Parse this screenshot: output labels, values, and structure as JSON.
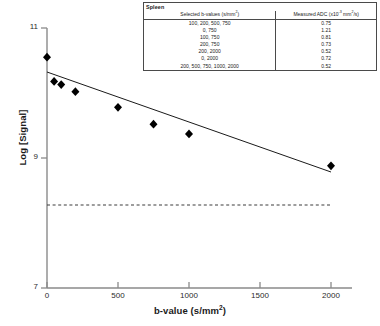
{
  "chart_data": {
    "type": "scatter",
    "title": "",
    "xlabel": "b-value (s/mm2)",
    "ylabel": "Log [Signal]",
    "xlim": [
      0,
      2100
    ],
    "ylim": [
      7,
      11
    ],
    "xticks": [
      0,
      500,
      1000,
      1500,
      2000
    ],
    "yticks": [
      7,
      9,
      11
    ],
    "grid": false,
    "legend": null,
    "series": [
      {
        "name": "Measured signal",
        "type": "scatter",
        "marker": "diamond",
        "color": "#000000",
        "points": [
          {
            "x": 0,
            "y": 10.72
          },
          {
            "x": 50,
            "y": 10.35
          },
          {
            "x": 100,
            "y": 10.3
          },
          {
            "x": 200,
            "y": 10.19
          },
          {
            "x": 500,
            "y": 9.95
          },
          {
            "x": 750,
            "y": 9.69
          },
          {
            "x": 1000,
            "y": 9.54
          },
          {
            "x": 2000,
            "y": 9.05
          }
        ]
      },
      {
        "name": "Monoexponential fit",
        "type": "line",
        "color": "#000000",
        "points": [
          {
            "x": 0,
            "y": 10.32
          },
          {
            "x": 2000,
            "y": 8.78
          }
        ]
      },
      {
        "name": "Noise floor",
        "type": "line",
        "style": "dashed",
        "color": "#3c3c3c",
        "points": [
          {
            "x": 0,
            "y": 8.28
          },
          {
            "x": 2000,
            "y": 8.28
          }
        ]
      }
    ]
  },
  "table": {
    "title": "Spleen",
    "headers": {
      "b_values": "Selected b-values (s/mm2)",
      "adc": "Measured ADC (x10-3 mm2/s)"
    },
    "rows": [
      {
        "b_values": "100, 200, 500, 750",
        "adc": "0.75"
      },
      {
        "b_values": "0, 750",
        "adc": "1.21"
      },
      {
        "b_values": "100, 750",
        "adc": "0.81"
      },
      {
        "b_values": "200, 750",
        "adc": "0.73"
      },
      {
        "b_values": "200, 2000",
        "adc": "0.52"
      },
      {
        "b_values": "0, 2000",
        "adc": "0.72"
      },
      {
        "b_values": "200, 500, 750, 1000, 2000",
        "adc": "0.52"
      }
    ]
  },
  "axes": {
    "y_title": "Log [Signal]",
    "x_title": "b-value (s/mm",
    "x_title_sup": "2",
    "x_title_tail": ")",
    "y_tick_labels": [
      "11",
      "9",
      "7"
    ],
    "x_tick_labels": [
      "0",
      "500",
      "1000",
      "1500",
      "2000"
    ]
  }
}
